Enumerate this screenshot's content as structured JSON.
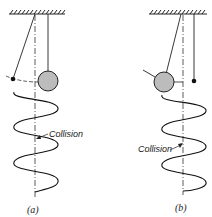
{
  "figure": {
    "panels": [
      {
        "id": "a",
        "caption": "(a)",
        "annotation": "Collision",
        "description": "Small bob pendulum displaced left; large ball hangs at rest; helical trajectory below with collision point"
      },
      {
        "id": "b",
        "caption": "(b)",
        "annotation": "Collision",
        "description": "Large ball pendulum displaced left; small bob hangs at rest; helical trajectory below with collision point"
      }
    ],
    "colors": {
      "line": "#222222",
      "ball_fill": "#bdbdbd",
      "background": "#ffffff"
    }
  }
}
